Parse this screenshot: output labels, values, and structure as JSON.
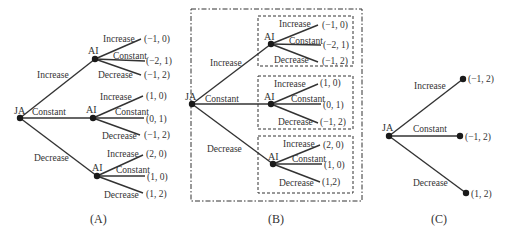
{
  "panels": {
    "A": {
      "caption": "(A)",
      "root": {
        "label": "JA"
      },
      "branches": [
        {
          "action": "Increase",
          "child": "AI",
          "leaves": [
            {
              "action": "Increase",
              "payoff": "(−1, 0)"
            },
            {
              "action": "Constant",
              "payoff": "(−2, 1)"
            },
            {
              "action": "Decrease",
              "payoff": "(−1, 2)"
            }
          ]
        },
        {
          "action": "Constant",
          "child": "AI",
          "leaves": [
            {
              "action": "Increase",
              "payoff": "(1, 0)"
            },
            {
              "action": "Constant",
              "payoff": "(0, 1)"
            },
            {
              "action": "Decrease",
              "payoff": "(−1, 2)"
            }
          ]
        },
        {
          "action": "Decrease",
          "child": "AI",
          "leaves": [
            {
              "action": "Increase",
              "payoff": "(2, 0)"
            },
            {
              "action": "Constant",
              "payoff": "(1, 0)"
            },
            {
              "action": "Decrease",
              "payoff": "(1, 2)"
            }
          ]
        }
      ]
    },
    "B": {
      "caption": "(B)",
      "root": {
        "label": "JA"
      },
      "branches": [
        {
          "action": "Increase",
          "child": "AI",
          "leaves": [
            {
              "action": "Increase",
              "payoff": "(−1, 0)"
            },
            {
              "action": "Constant",
              "payoff": "(−2, 1)"
            },
            {
              "action": "Decrease",
              "payoff": "(−1, 2)"
            }
          ]
        },
        {
          "action": "Constant",
          "child": "AI",
          "leaves": [
            {
              "action": "Increase",
              "payoff": "(1, 0)"
            },
            {
              "action": "Constant",
              "payoff": "(0, 1)"
            },
            {
              "action": "Decrease",
              "payoff": "(−1, 2)"
            }
          ]
        },
        {
          "action": "Decrease",
          "child": "AI",
          "leaves": [
            {
              "action": "Increase",
              "payoff": "(2, 0)"
            },
            {
              "action": "Constant",
              "payoff": "(1, 0)"
            },
            {
              "action": "Decrease",
              "payoff": "(1,2)"
            }
          ]
        }
      ]
    },
    "C": {
      "caption": "(C)",
      "root": {
        "label": "JA"
      },
      "branches": [
        {
          "action": "Increase",
          "payoff": "(−1, 2)"
        },
        {
          "action": "Constant",
          "payoff": "(−1, 2)"
        },
        {
          "action": "Decrease",
          "payoff": "(1, 2)"
        }
      ]
    }
  }
}
